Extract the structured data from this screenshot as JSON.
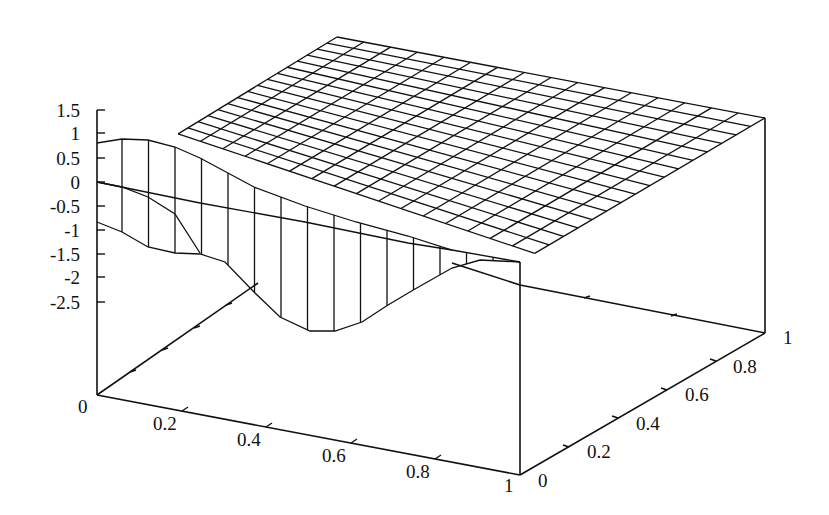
{
  "chart_data": {
    "type": "surface3d",
    "title": "",
    "xlabel": "",
    "ylabel": "",
    "zlabel": "",
    "x_ticks": [
      "0",
      "0.2",
      "0.4",
      "0.6",
      "0.8",
      "1"
    ],
    "y_ticks": [
      "0",
      "0.2",
      "0.4",
      "0.6",
      "0.8",
      "1"
    ],
    "z_ticks": [
      "1.5",
      "1",
      "0.5",
      "0",
      "-0.5",
      "-1",
      "-1.5",
      "-2",
      "-2.5"
    ],
    "xlim": [
      0,
      1
    ],
    "ylim": [
      0,
      1
    ],
    "zlim": [
      -2.5,
      1.5
    ],
    "grid": false,
    "legend": null,
    "mesh_lines": {
      "along_x": 16,
      "along_y": 16
    },
    "front_edge_profile": {
      "x": [
        0.0,
        0.1,
        0.2,
        0.3,
        0.4,
        0.5,
        0.6,
        0.7,
        0.8,
        0.9,
        1.0
      ],
      "z_top": [
        0.9,
        0.95,
        0.9,
        0.7,
        0.4,
        0.2,
        0.15,
        0.15,
        0.2,
        0.3,
        0.4
      ],
      "z_bottom": [
        -0.8,
        -1.3,
        -1.6,
        -2.2,
        -2.6,
        -2.5,
        -2.2,
        -1.6,
        -1.0,
        -0.9,
        -0.8
      ]
    }
  },
  "axis_labels": {
    "z": [
      "1.5",
      "1",
      "0.5",
      "0",
      "-0.5",
      "-1",
      "-1.5",
      "-2",
      "-2.5"
    ],
    "x": [
      "0.2",
      "0.4",
      "0.6",
      "0.8",
      "1"
    ],
    "x_origin": "0",
    "y": [
      "0",
      "0.2",
      "0.4",
      "0.6",
      "0.8",
      "1"
    ]
  }
}
